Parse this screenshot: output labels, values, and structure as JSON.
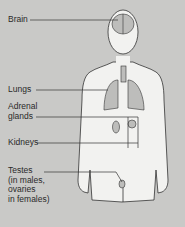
{
  "diagram": {
    "title": "",
    "background_color": "#c9c9c7",
    "body_fill": "#f2f2f0",
    "organ_fill": "#bdbdbb",
    "line_color": "#333333",
    "labels": [
      {
        "id": "brain",
        "text": "Brain"
      },
      {
        "id": "lungs",
        "text": "Lungs"
      },
      {
        "id": "adrenal",
        "text": "Adrenal\nglands"
      },
      {
        "id": "kidneys",
        "text": "Kidneys"
      },
      {
        "id": "testes",
        "text": "Testes\n(in males,\novaries\nin females)"
      }
    ]
  }
}
